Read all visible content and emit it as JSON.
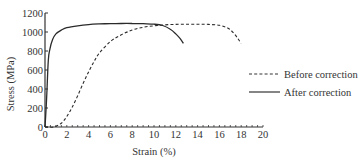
{
  "chart_data": {
    "type": "line",
    "title": "",
    "xlabel": "Strain (%)",
    "ylabel": "Stress (MPa)",
    "xlim": [
      0,
      20
    ],
    "ylim": [
      0,
      1200
    ],
    "x_ticks": [
      0,
      2,
      4,
      6,
      8,
      10,
      12,
      14,
      16,
      18,
      20
    ],
    "y_ticks": [
      0,
      200,
      400,
      600,
      800,
      1000,
      1200
    ],
    "grid": false,
    "legend_position": "right",
    "series": [
      {
        "name": "Before correction",
        "style": "dashed",
        "x": [
          0,
          0.8,
          1.5,
          2.0,
          2.5,
          3.0,
          3.5,
          4.0,
          4.5,
          5.0,
          6.0,
          7.0,
          8.0,
          9.0,
          10.0,
          11.0,
          12.0,
          13.0,
          14.0,
          15.0,
          16.0,
          16.8,
          17.3,
          17.7,
          18.0
        ],
        "y": [
          0,
          0,
          40,
          110,
          210,
          330,
          460,
          580,
          690,
          780,
          900,
          970,
          1020,
          1050,
          1065,
          1075,
          1080,
          1082,
          1082,
          1080,
          1070,
          1040,
          990,
          930,
          880
        ]
      },
      {
        "name": "After correction",
        "style": "solid",
        "x": [
          0,
          0.15,
          0.3,
          0.45,
          0.7,
          1.0,
          1.5,
          2.0,
          3.0,
          4.0,
          5.0,
          6.0,
          7.0,
          8.0,
          9.0,
          10.0,
          10.8,
          11.5,
          12.0,
          12.4,
          12.7
        ],
        "y": [
          0,
          300,
          700,
          820,
          920,
          980,
          1020,
          1045,
          1065,
          1078,
          1085,
          1088,
          1090,
          1090,
          1088,
          1082,
          1068,
          1030,
          980,
          930,
          880
        ]
      }
    ],
    "legend": [
      "Before correction",
      "After correction"
    ]
  }
}
